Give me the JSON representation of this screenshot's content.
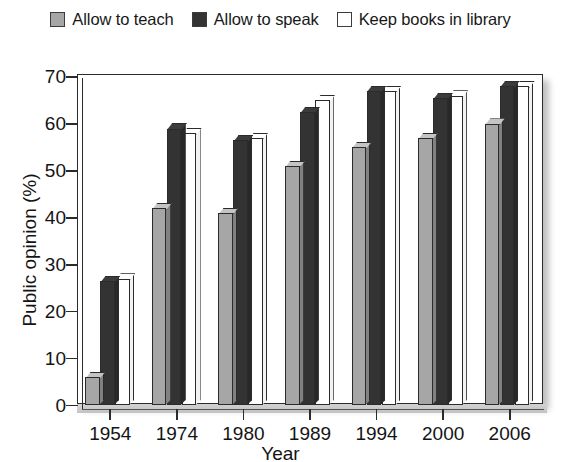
{
  "legend": {
    "items": [
      {
        "label": "Allow to teach",
        "color": "#a6a6a6",
        "key": "teach"
      },
      {
        "label": "Allow to speak",
        "color": "#333333",
        "key": "speak"
      },
      {
        "label": "Keep books in library",
        "color": "#ffffff",
        "key": "books"
      }
    ]
  },
  "chart_data": {
    "type": "bar",
    "title": "",
    "xlabel": "Year",
    "ylabel": "Public opinion (%)",
    "categories": [
      "1954",
      "1974",
      "1980",
      "1989",
      "1994",
      "2000",
      "2006"
    ],
    "series": [
      {
        "name": "Allow to teach",
        "color": "#a6a6a6",
        "values": [
          6,
          42,
          41,
          51,
          55,
          57,
          60
        ]
      },
      {
        "name": "Allow to speak",
        "color": "#333333",
        "values": [
          26.5,
          59,
          56.5,
          62.5,
          67,
          65.5,
          68
        ]
      },
      {
        "name": "Keep books in library",
        "color": "#ffffff",
        "values": [
          27,
          58,
          57,
          65,
          67,
          66,
          68
        ]
      }
    ],
    "ylim": [
      0,
      70
    ],
    "yticks": [
      0,
      10,
      20,
      30,
      40,
      50,
      60,
      70
    ],
    "grid": false,
    "legend_position": "top"
  }
}
